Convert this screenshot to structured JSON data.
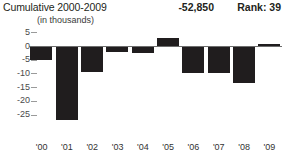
{
  "header": {
    "title": "Cumulative 2000-2009",
    "units": "(in thousands)",
    "total": "-52,850",
    "rank": "Rank: 39"
  },
  "chart_data": {
    "type": "bar",
    "title": "Cumulative 2000-2009",
    "subtitle": "(in thousands)",
    "xlabel": "",
    "ylabel": "",
    "categories": [
      "'00",
      "'01",
      "'02",
      "'03",
      "'04",
      "'05",
      "'06",
      "'07",
      "'08",
      "'09"
    ],
    "values": [
      -5,
      -27,
      -9.5,
      -2,
      -2.5,
      3,
      -10,
      -10,
      -13.5,
      0.7
    ],
    "ylim": [
      -27.5,
      7
    ],
    "yticks": [
      5,
      0,
      -5,
      -10,
      -15,
      -20,
      -25
    ],
    "ytick_labels": [
      "5",
      "0",
      "-5",
      "-10",
      "-15",
      "-20",
      "-25"
    ],
    "grid": false,
    "legend": false,
    "bar_color": "#201d1e",
    "zero_line_color": "#6d6d6d",
    "annotations": {
      "cumulative_total": "-52,850",
      "rank": "Rank: 39"
    }
  }
}
